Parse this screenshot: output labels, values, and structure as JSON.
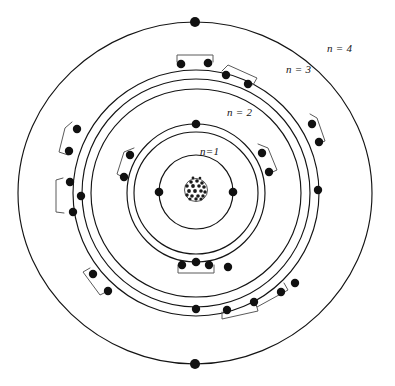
{
  "diagram": {
    "style": "hand-drawn pen sketch",
    "background_color": "#ffffff",
    "ink_color": "#141414",
    "center": {
      "x": 195,
      "y": 193
    },
    "nucleus": {
      "name": "nucleus",
      "center": {
        "x": 196,
        "y": 190
      },
      "radius": 11,
      "texture": "stippled cluster of nucleons"
    },
    "shell_labels": [
      {
        "id": "n1",
        "text": "n=1",
        "x": 200,
        "y": 155
      },
      {
        "id": "n2",
        "text": "n = 2",
        "x": 227,
        "y": 116
      },
      {
        "id": "n3",
        "text": "n = 3",
        "x": 286,
        "y": 73
      },
      {
        "id": "n4",
        "text": "n = 4",
        "x": 327,
        "y": 52
      }
    ],
    "shells": [
      {
        "id": "n1",
        "label": "n = 1",
        "radius": 37,
        "orbit_count": 1,
        "electron_count": 2,
        "electron_angles": [
          180,
          0
        ]
      },
      {
        "id": "n2",
        "label": "n = 2",
        "radius": 62,
        "orbit_count": 2,
        "electron_count": 8,
        "electron_angles": [
          270,
          90,
          205,
          228,
          335,
          312,
          252,
          288
        ]
      },
      {
        "id": "n3",
        "label": "n = 3",
        "radius": 104,
        "orbit_count": 3,
        "electron_count": 14,
        "electron_angles": [
          100,
          80,
          60,
          45,
          20,
          160,
          185,
          200,
          215,
          240,
          262,
          285,
          305,
          325
        ]
      },
      {
        "id": "n4",
        "label": "n = 4",
        "radius": 171,
        "orbit_count": 1,
        "electron_count": 2,
        "electron_angles": [
          90,
          270
        ]
      }
    ],
    "electron_dot_radius": 4.2,
    "brackets": [
      {
        "id": "bracket-n2-right",
        "note": "pairs electrons on right of n=2"
      },
      {
        "id": "bracket-n2-left",
        "note": "pairs electrons on left of n=2"
      },
      {
        "id": "bracket-n2-bottom",
        "note": "pairs electrons at bottom of n=2"
      },
      {
        "id": "bracket-n3-top",
        "note": "pairs electrons at top of n=3"
      },
      {
        "id": "bracket-n3-topright",
        "note": "pairs electrons top-right of n=3"
      },
      {
        "id": "bracket-n3-right",
        "note": "pairs electrons on right of n=3"
      },
      {
        "id": "bracket-n3-left",
        "note": "pairs electrons on left of n=3"
      },
      {
        "id": "bracket-n3-lowerleft",
        "note": "pairs electrons lower-left of n=3"
      },
      {
        "id": "bracket-n3-bottomleft",
        "note": "pairs electrons bottom-left of n=3"
      },
      {
        "id": "bracket-n3-bottom",
        "note": "pairs electrons at bottom of n=3"
      },
      {
        "id": "bracket-n3-bottomright",
        "note": "pairs electrons bottom-right of n=3"
      }
    ]
  }
}
